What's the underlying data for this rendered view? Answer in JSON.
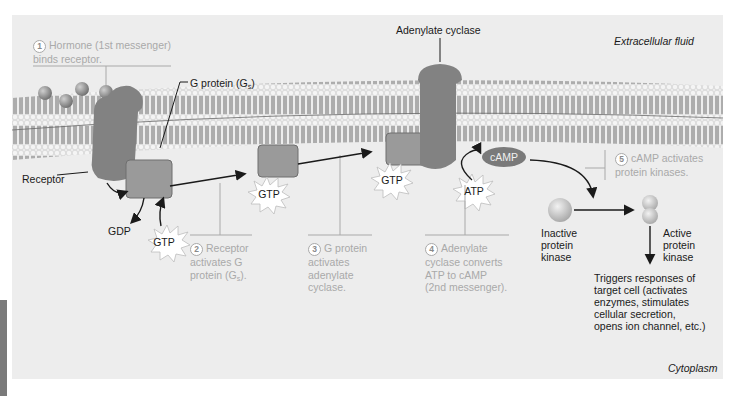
{
  "regions": {
    "extracellular": "Extracellular fluid",
    "cytoplasm": "Cytoplasm"
  },
  "labels": {
    "adenylate_cyclase": "Adenylate cyclase",
    "g_protein": "G protein (G",
    "g_protein_sub": "s",
    "g_protein_close": ")",
    "receptor": "Receptor",
    "gdp": "GDP",
    "gtp": "GTP",
    "atp": "ATP",
    "camp": "cAMP",
    "inactive_kinase": [
      "Inactive",
      "protein",
      "kinase"
    ],
    "active_kinase": [
      "Active",
      "protein",
      "kinase"
    ],
    "response": [
      "Triggers responses of",
      "target cell (activates",
      "enzymes, stimulates",
      "cellular secretion,",
      "opens ion channel, etc.)"
    ]
  },
  "steps": [
    {
      "n": "1",
      "lines": [
        "Hormone (1st messenger)",
        "binds receptor."
      ]
    },
    {
      "n": "2",
      "lines": [
        "Receptor",
        "activates G",
        "protein (G"
      ],
      "sub": "s",
      "tail": ")."
    },
    {
      "n": "3",
      "lines": [
        "G protein",
        "activates",
        "adenylate",
        "cyclase."
      ]
    },
    {
      "n": "4",
      "lines": [
        "Adenylate",
        "cyclase converts",
        "ATP to cAMP",
        "(2nd messenger)."
      ]
    },
    {
      "n": "5",
      "lines": [
        "cAMP activates",
        "protein kinases."
      ]
    }
  ],
  "colors": {
    "panel": "#ededed",
    "protein": "#808080",
    "step_text": "#a9a9a9",
    "label_text": "#1a1a1a"
  }
}
